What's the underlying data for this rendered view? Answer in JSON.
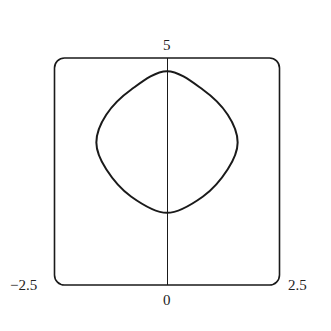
{
  "chart_data": {
    "type": "line",
    "title": "",
    "xlabel": "",
    "ylabel": "",
    "xlim": [
      -2.5,
      2.5
    ],
    "ylim": [
      0,
      5
    ],
    "grid": false,
    "tick_labels": {
      "x_min": "−2.5",
      "x_max": "2.5",
      "x_origin": "0",
      "y_max": "5"
    },
    "series": [
      {
        "name": "closed curve",
        "closed": true,
        "points": [
          [
            0,
            4.71
          ],
          [
            0.8,
            4.3
          ],
          [
            1.35,
            3.75
          ],
          [
            1.57,
            3.14
          ],
          [
            1.35,
            2.55
          ],
          [
            0.8,
            1.95
          ],
          [
            0,
            1.59
          ],
          [
            -0.8,
            1.95
          ],
          [
            -1.35,
            2.55
          ],
          [
            -1.57,
            3.14
          ],
          [
            -1.35,
            3.75
          ],
          [
            -0.8,
            4.3
          ]
        ]
      }
    ],
    "axis_line": {
      "x": 0,
      "from_y": 0,
      "to_y": 5
    }
  },
  "colors": {
    "stroke": "#1a1a1a",
    "background": "#ffffff"
  }
}
